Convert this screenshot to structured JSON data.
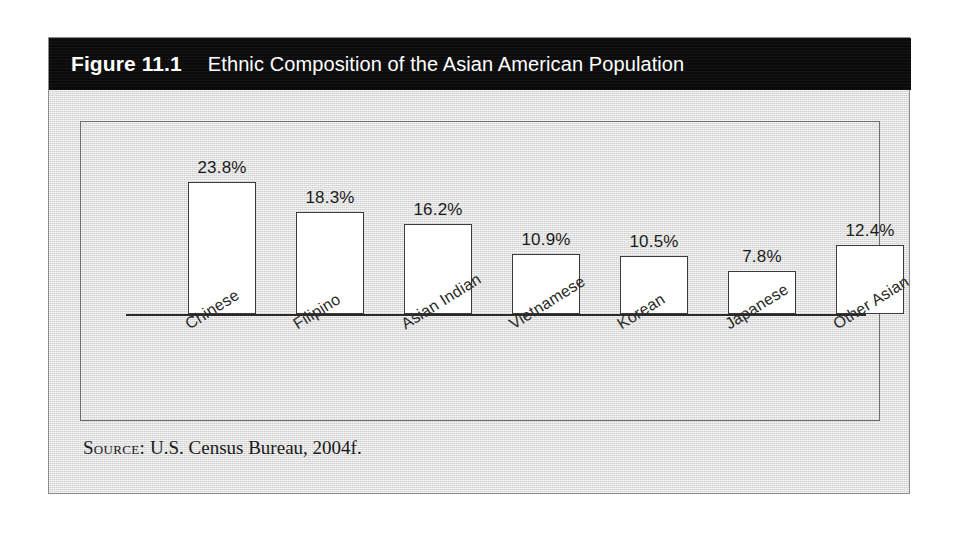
{
  "figure": {
    "number": "Figure 11.1",
    "title": "Ethnic Composition of the Asian American Population",
    "header_bg": "#0b0b0b",
    "panel_bg": "#dcdcdc"
  },
  "source": {
    "label": "Source:",
    "text": "U.S. Census Bureau, 2004f."
  },
  "chart_data": {
    "type": "bar",
    "title": "Ethnic Composition of the Asian American Population",
    "xlabel": "",
    "ylabel": "",
    "ylim": [
      0,
      25
    ],
    "grid": false,
    "legend": null,
    "value_suffix": "%",
    "bar_fill": "#ffffff",
    "bar_stroke": "#3a3a3a",
    "categories": [
      "Chinese",
      "Filipino",
      "Asian Indian",
      "Vietnamese",
      "Korean",
      "Japanese",
      "Other Asian"
    ],
    "values": [
      23.8,
      18.3,
      16.2,
      10.9,
      10.5,
      7.8,
      12.4
    ],
    "labels": [
      "23.8%",
      "18.3%",
      "16.2%",
      "10.9%",
      "10.5%",
      "7.8%",
      "12.4%"
    ]
  }
}
